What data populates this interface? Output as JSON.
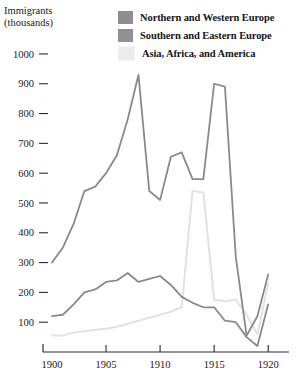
{
  "chart_data": {
    "type": "line",
    "title": "",
    "ylabel": "Immigrants\n(thousands)",
    "xlabel": "",
    "x": [
      1900,
      1901,
      1902,
      1903,
      1904,
      1905,
      1906,
      1907,
      1908,
      1909,
      1910,
      1911,
      1912,
      1913,
      1914,
      1915,
      1916,
      1917,
      1918,
      1919,
      1920
    ],
    "xlim": [
      1900,
      1921
    ],
    "ylim": [
      0,
      1030
    ],
    "xticks": [
      1900,
      1905,
      1910,
      1915,
      1920
    ],
    "xtick_labels": [
      "1900",
      "1905",
      "1910",
      "1915",
      "1920"
    ],
    "yticks": [
      100,
      200,
      300,
      400,
      500,
      600,
      700,
      800,
      900,
      1000
    ],
    "ytick_labels": [
      "100",
      "200",
      "300",
      "400",
      "500",
      "600",
      "700",
      "800",
      "900",
      "1000"
    ],
    "grid": false,
    "legend_position": "top-right",
    "series": [
      {
        "name": "Northern and Western Europe",
        "color": "#8a8a8a",
        "values": [
          300,
          350,
          430,
          540,
          555,
          600,
          660,
          780,
          930,
          540,
          510,
          655,
          670,
          580,
          580,
          900,
          890,
          320,
          55,
          120,
          260
        ]
      },
      {
        "name": "Southern and Eastern Europe",
        "color": "#8a8a8a",
        "values": [
          120,
          125,
          160,
          200,
          210,
          235,
          240,
          265,
          235,
          245,
          255,
          225,
          185,
          165,
          150,
          150,
          105,
          100,
          50,
          20,
          160
        ]
      },
      {
        "name": "Asia, Africa, and America",
        "color": "#e2e2e2",
        "values": [
          55,
          55,
          65,
          70,
          75,
          78,
          85,
          95,
          105,
          115,
          125,
          135,
          150,
          540,
          535,
          175,
          170,
          175,
          125,
          60,
          230
        ]
      }
    ]
  },
  "legend": {
    "items": [
      {
        "label": "Northern and Western Europe",
        "swatch": "#8e8e8e"
      },
      {
        "label": "Southern and Eastern Europe",
        "swatch": "#919191"
      },
      {
        "label": "Asia, Africa, and America",
        "swatch": "#ececec"
      }
    ]
  },
  "axis": {
    "y_title": "Immigrants\n(thousands)"
  }
}
